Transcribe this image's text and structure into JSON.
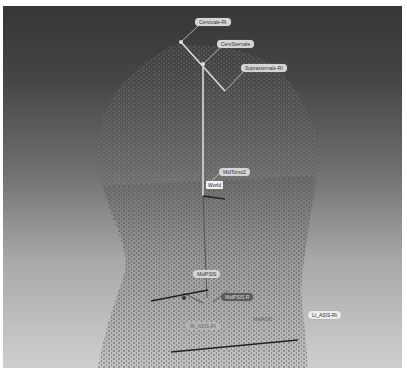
{
  "viewport": {
    "background_top": "#363636",
    "background_bottom": "#cfcfcf",
    "model": "torso-point-cloud"
  },
  "markers": [
    {
      "id": "cervicale",
      "label": "Cervicale-Rt"
    },
    {
      "id": "cervsternale",
      "label": "CervSternale"
    },
    {
      "id": "suprasternale",
      "label": "Suprasternale-Rt"
    },
    {
      "id": "midtorso",
      "label": "MidTorso2"
    },
    {
      "id": "world",
      "label": "World"
    },
    {
      "id": "midpsis",
      "label": "MidPSIS"
    },
    {
      "id": "midpsis-r",
      "label": "MidPSIS R"
    },
    {
      "id": "midasis",
      "label": "MidASIS"
    },
    {
      "id": "rt-asis",
      "label": "Rt_ASIS-Rt"
    },
    {
      "id": "lt-asis",
      "label": "Lt_ASIS-Rt"
    }
  ]
}
